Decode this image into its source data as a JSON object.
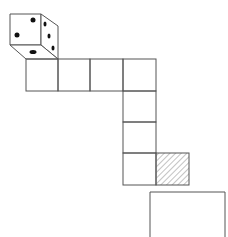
{
  "diagram": {
    "colors": {
      "line": "#555555",
      "pip": "#111111",
      "hatch": "#888888",
      "background": "#ffffff"
    },
    "die": {
      "front_face_pips": 2,
      "right_face_pips": 3,
      "bottom_face_pips": 1
    },
    "path_squares": [
      {
        "x": 26,
        "y": 59
      },
      {
        "x": 58,
        "y": 59
      },
      {
        "x": 90,
        "y": 59
      },
      {
        "x": 123,
        "y": 59
      },
      {
        "x": 123,
        "y": 91
      },
      {
        "x": 123,
        "y": 122
      },
      {
        "x": 123,
        "y": 153
      }
    ],
    "hatched_square": {
      "x": 156,
      "y": 153
    },
    "square_size": 32,
    "open_box": {
      "x": 150,
      "y": 192,
      "width": 75
    }
  }
}
